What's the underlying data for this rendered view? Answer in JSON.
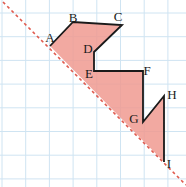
{
  "figure": {
    "name": "grid-polygon-reflection-figure",
    "width": 186,
    "height": 187,
    "background_color": "#ffffff"
  },
  "grid": {
    "line_color": "#cfe4f2",
    "spacing": 23.7,
    "origin_x": 2,
    "origin_y": 13,
    "vertical_lines": [
      2,
      25.7,
      49.4,
      73.1,
      96.8,
      120.5,
      144.2,
      167.9
    ],
    "horizontal_lines": [
      13,
      36.7,
      60.4,
      84.1,
      107.8,
      131.5,
      155.2,
      178.9
    ]
  },
  "mirror_line": {
    "name": "dashed-diagonal-mirror-line",
    "color": "#e05a4e",
    "style": "dashed",
    "dash_pattern": "3 3",
    "width": 1.6,
    "x1": 3,
    "y1": 2,
    "x2": 186,
    "y2": 185
  },
  "shape": {
    "name": "staircase-polygon",
    "fill_color": "#f09a90",
    "fill_opacity": 0.85,
    "stroke_color": "#1a1a1a",
    "stroke_width": 1.8,
    "outline_points": "50,46 73,22 122,25 94,52 94,71 143,71 143,122 164,96 164,162",
    "closing_edge": "from I back to A along the dashed mirror line"
  },
  "vertices": [
    {
      "id": "A",
      "label": "A",
      "px": 50,
      "py": 46,
      "label_x": 50,
      "label_y": 37
    },
    {
      "id": "B",
      "label": "B",
      "px": 73,
      "py": 22,
      "label_x": 73,
      "label_y": 17
    },
    {
      "id": "C",
      "label": "C",
      "px": 122,
      "py": 25,
      "label_x": 118,
      "label_y": 16
    },
    {
      "id": "D",
      "label": "D",
      "px": 94,
      "py": 52,
      "label_x": 88,
      "label_y": 48
    },
    {
      "id": "E",
      "label": "E",
      "px": 94,
      "py": 71,
      "label_x": 89,
      "label_y": 73
    },
    {
      "id": "F",
      "label": "F",
      "px": 143,
      "py": 71,
      "label_x": 147,
      "label_y": 70
    },
    {
      "id": "G",
      "label": "G",
      "px": 143,
      "py": 122,
      "label_x": 134,
      "label_y": 118
    },
    {
      "id": "H",
      "label": "H",
      "px": 164,
      "py": 96,
      "label_x": 172,
      "label_y": 94
    },
    {
      "id": "I",
      "label": "I",
      "px": 164,
      "py": 162,
      "label_x": 169,
      "label_y": 163
    }
  ]
}
